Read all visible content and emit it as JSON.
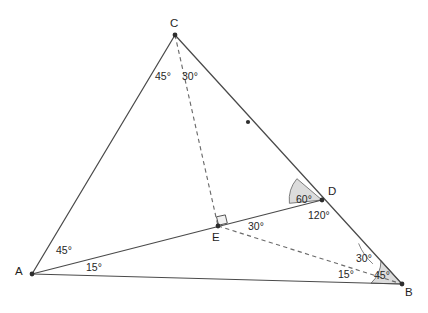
{
  "figure": {
    "background_color": "#ffffff",
    "line_color": "#4a4a4a",
    "dashed_color": "#6b6b6b",
    "sector_fill_color": "#dcdcdc",
    "vertices": [
      {
        "name": "A",
        "label": "A",
        "x": 32,
        "y": 274
      },
      {
        "name": "B",
        "label": "B",
        "x": 402,
        "y": 284
      },
      {
        "name": "C",
        "label": "C",
        "x": 175,
        "y": 35
      },
      {
        "name": "D",
        "label": "D",
        "x": 322,
        "y": 200
      },
      {
        "name": "E",
        "label": "E",
        "x": 218,
        "y": 226
      }
    ],
    "vertex_labels": [
      {
        "name": "C",
        "text": "C",
        "x": 170,
        "y": 18
      },
      {
        "name": "A",
        "text": "A",
        "x": 15,
        "y": 266
      },
      {
        "name": "B",
        "text": "B",
        "x": 405,
        "y": 287
      },
      {
        "name": "D",
        "text": "D",
        "x": 328,
        "y": 186
      },
      {
        "name": "E",
        "text": "E",
        "x": 212,
        "y": 232
      }
    ],
    "solid_segments": [
      {
        "name": "segment-A-C",
        "from": "A",
        "to": "C"
      },
      {
        "name": "segment-C-B",
        "from": "C",
        "to": "B"
      },
      {
        "name": "segment-A-B",
        "from": "A",
        "to": "B"
      },
      {
        "name": "segment-A-D",
        "from": "A",
        "to": "D"
      }
    ],
    "dashed_segments": [
      {
        "name": "segment-C-E-dashed",
        "from": "C",
        "to": "E"
      },
      {
        "name": "segment-E-B-dashed",
        "from": "E",
        "to": "B"
      }
    ],
    "tick_marks": [
      {
        "name": "midpoint-tick-CB",
        "x": 248,
        "y": 122
      }
    ],
    "right_angle_marker": {
      "name": "right-angle-at-E",
      "x": 218,
      "y": 226,
      "size": 9
    },
    "angle_labels": [
      {
        "name": "angle-label-C-left",
        "text": "45°",
        "x": 155,
        "y": 71
      },
      {
        "name": "angle-label-C-right",
        "text": "30°",
        "x": 182,
        "y": 71
      },
      {
        "name": "angle-label-A-upper",
        "text": "45°",
        "x": 56,
        "y": 245
      },
      {
        "name": "angle-label-A-lower",
        "text": "15°",
        "x": 86,
        "y": 262
      },
      {
        "name": "angle-label-D-inner",
        "text": "60°",
        "x": 296,
        "y": 194
      },
      {
        "name": "angle-label-D-outer",
        "text": "120°",
        "x": 308,
        "y": 210
      },
      {
        "name": "angle-label-E-right",
        "text": "30°",
        "x": 248,
        "y": 221
      },
      {
        "name": "angle-label-B-upper",
        "text": "30°",
        "x": 356,
        "y": 253
      },
      {
        "name": "angle-label-B-left",
        "text": "15°",
        "x": 338,
        "y": 269
      },
      {
        "name": "angle-label-B-inner",
        "text": "45°",
        "x": 374,
        "y": 270
      }
    ],
    "shaded_sectors": [
      {
        "name": "sector-60-at-D",
        "measure": "60°"
      },
      {
        "name": "sector-45-at-B",
        "measure": "45°"
      }
    ]
  }
}
